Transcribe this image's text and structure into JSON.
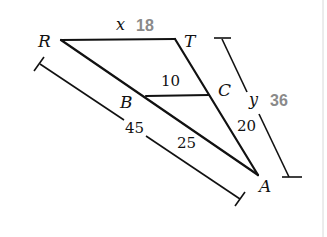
{
  "diagram": {
    "type": "similar-triangles",
    "vertices": {
      "R": {
        "label": "R"
      },
      "T": {
        "label": "T"
      },
      "B": {
        "label": "B"
      },
      "C": {
        "label": "C"
      },
      "A": {
        "label": "A"
      }
    },
    "segments": {
      "RT": {
        "variable": "x",
        "answer": "18"
      },
      "BC": {
        "length": "10"
      },
      "RA": {
        "length": "45"
      },
      "BA": {
        "length": "25"
      },
      "CA": {
        "length": "20"
      },
      "TA": {
        "variable": "y",
        "answer": "36"
      }
    },
    "colors": {
      "lines": "#111111",
      "answers": "#8a8a8a"
    }
  }
}
